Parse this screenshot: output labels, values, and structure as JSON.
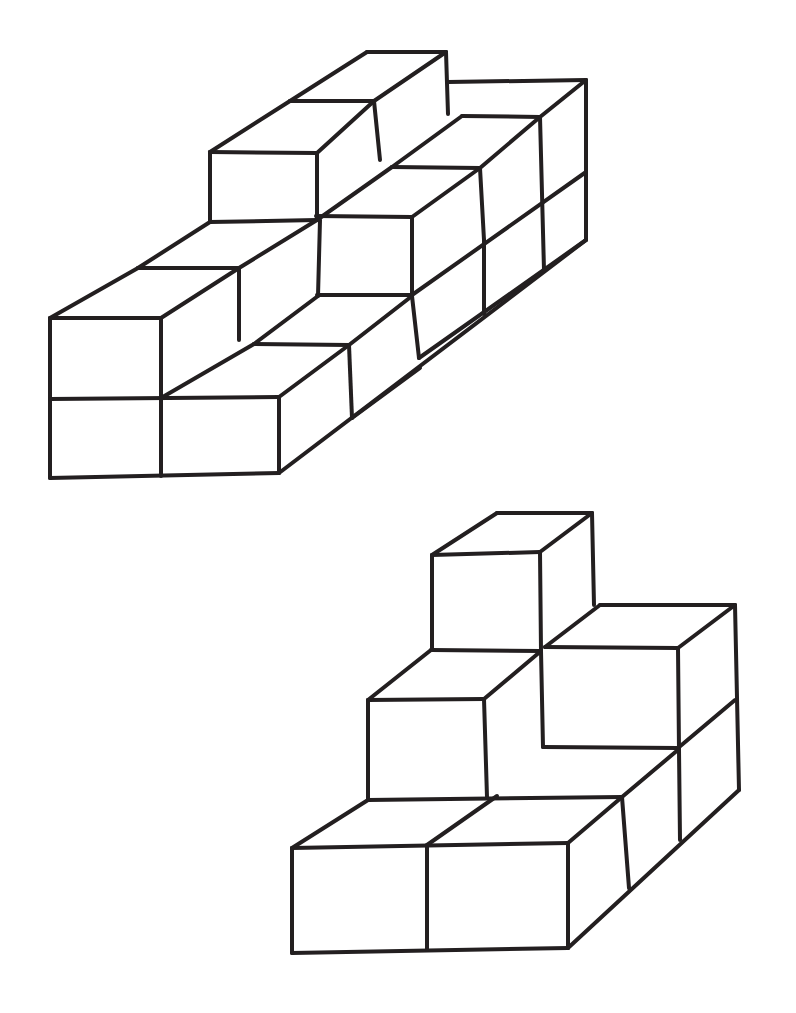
{
  "diagram": {
    "background": "#ffffff",
    "stroke_color": "#231f20",
    "figures": [
      {
        "name": "cube-structure-1",
        "description": "Isometric line drawing of stacked unit cubes forming a stepped wall",
        "lines": [
          [
            50,
            318,
            50,
            478
          ],
          [
            50,
            478,
            279,
            473
          ],
          [
            50,
            399,
            279,
            397
          ],
          [
            161,
            318,
            161,
            476
          ],
          [
            279,
            397,
            279,
            473
          ],
          [
            50,
            318,
            161,
            318
          ],
          [
            50,
            318,
            138,
            268
          ],
          [
            161,
            318,
            239,
            268
          ],
          [
            138,
            268,
            239,
            268
          ],
          [
            161,
            398,
            254,
            344
          ],
          [
            279,
            397,
            349,
            345
          ],
          [
            254,
            344,
            349,
            345
          ],
          [
            349,
            345,
            352,
            418
          ],
          [
            279,
            473,
            586,
            240
          ],
          [
            352,
            418,
            420,
            368
          ],
          [
            138,
            268,
            210,
            222
          ],
          [
            239,
            268,
            239,
            340
          ],
          [
            210,
            222,
            317,
            220
          ],
          [
            210,
            152,
            210,
            222
          ],
          [
            210,
            152,
            317,
            153
          ],
          [
            210,
            152,
            290,
            101
          ],
          [
            290,
            101,
            374,
            101
          ],
          [
            317,
            153,
            374,
            101
          ],
          [
            317,
            153,
            317,
            218
          ],
          [
            239,
            268,
            317,
            220
          ],
          [
            290,
            101,
            367,
            52
          ],
          [
            367,
            52,
            446,
            52
          ],
          [
            374,
            101,
            446,
            52
          ],
          [
            446,
            52,
            448,
            114
          ],
          [
            374,
            101,
            380,
            160
          ],
          [
            317,
            220,
            392,
            167
          ],
          [
            392,
            167,
            480,
            168
          ],
          [
            317,
            295,
            412,
            295
          ],
          [
            320,
            220,
            318,
            296
          ],
          [
            412,
            217,
            412,
            295
          ],
          [
            412,
            217,
            480,
            168
          ],
          [
            412,
            217,
            316,
            216
          ],
          [
            254,
            344,
            318,
            296
          ],
          [
            349,
            345,
            412,
            296
          ],
          [
            412,
            296,
            419,
            358
          ],
          [
            480,
            168,
            484,
            240
          ],
          [
            480,
            168,
            540,
            117
          ],
          [
            392,
            167,
            462,
            116
          ],
          [
            462,
            116,
            540,
            117
          ],
          [
            448,
            82,
            586,
            80
          ],
          [
            540,
            117,
            586,
            80
          ],
          [
            586,
            80,
            586,
            240
          ],
          [
            540,
            117,
            544,
            270
          ],
          [
            412,
            295,
            586,
            172
          ],
          [
            484,
            240,
            484,
            314
          ],
          [
            419,
            358,
            586,
            240
          ]
        ]
      },
      {
        "name": "cube-structure-2",
        "description": "Isometric line drawing of stacked unit cubes forming a stepped pyramid",
        "lines": [
          [
            292,
            848,
            292,
            953
          ],
          [
            292,
            953,
            568,
            948
          ],
          [
            292,
            848,
            568,
            843
          ],
          [
            427,
            845,
            427,
            950
          ],
          [
            568,
            843,
            568,
            948
          ],
          [
            292,
            848,
            368,
            800
          ],
          [
            427,
            845,
            497,
            796
          ],
          [
            568,
            843,
            622,
            797
          ],
          [
            368,
            800,
            622,
            797
          ],
          [
            368,
            700,
            368,
            800
          ],
          [
            484,
            699,
            487,
            797
          ],
          [
            368,
            700,
            484,
            699
          ],
          [
            368,
            700,
            431,
            650
          ],
          [
            484,
            699,
            541,
            651
          ],
          [
            431,
            650,
            541,
            651
          ],
          [
            541,
            651,
            543,
            747
          ],
          [
            543,
            747,
            678,
            748
          ],
          [
            622,
            797,
            679,
            749
          ],
          [
            432,
            555,
            432,
            650
          ],
          [
            540,
            552,
            541,
            651
          ],
          [
            432,
            555,
            540,
            552
          ],
          [
            432,
            555,
            497,
            513
          ],
          [
            540,
            552,
            592,
            513
          ],
          [
            497,
            513,
            592,
            513
          ],
          [
            592,
            513,
            594,
            605
          ],
          [
            545,
            647,
            600,
            605
          ],
          [
            600,
            605,
            735,
            605
          ],
          [
            545,
            647,
            678,
            648
          ],
          [
            678,
            648,
            735,
            605
          ],
          [
            678,
            648,
            679,
            750
          ],
          [
            735,
            605,
            739,
            790
          ],
          [
            678,
            748,
            735,
            700
          ],
          [
            622,
            797,
            629,
            888
          ],
          [
            679,
            750,
            680,
            840
          ],
          [
            568,
            948,
            739,
            790
          ]
        ]
      }
    ]
  }
}
